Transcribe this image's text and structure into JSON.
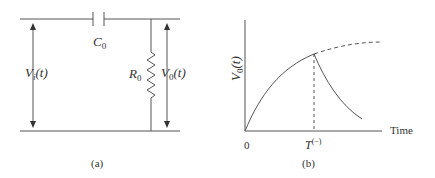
{
  "figure_a": {
    "caption": "(a)",
    "capacitor_label": {
      "main": "C",
      "sub": "0"
    },
    "resistor_label": {
      "main": "R",
      "sub": "0"
    },
    "input_voltage_label": {
      "main": "V",
      "sub": "i",
      "suffix": "(t)"
    },
    "output_voltage_label": {
      "main": "V",
      "sub": "0",
      "suffix": "(t)"
    }
  },
  "figure_b": {
    "caption": "(b)",
    "ylabel": {
      "main": "V",
      "sub": "0",
      "suffix": "(t)"
    },
    "xlabel": "Time",
    "origin_tick": "0",
    "t_tick": {
      "main": "T",
      "sup": "(−)"
    }
  },
  "colors": {
    "line": "#555555",
    "text": "#333333"
  }
}
